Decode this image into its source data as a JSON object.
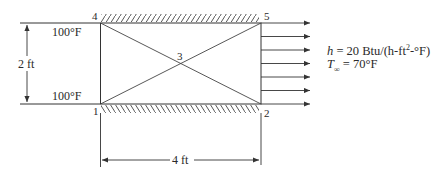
{
  "diagram": {
    "nodes": [
      {
        "id": "1",
        "label": "1"
      },
      {
        "id": "2",
        "label": "2"
      },
      {
        "id": "3",
        "label": "3"
      },
      {
        "id": "4",
        "label": "4"
      },
      {
        "id": "5",
        "label": "5"
      }
    ],
    "temperatures": {
      "top": "100°F",
      "bottom": "100°F"
    },
    "dimensions": {
      "height": "2 ft",
      "width": "4 ft"
    },
    "convection": {
      "h_symbol": "h",
      "h_value": " = 20 Btu/(h-ft",
      "h_exp": "2",
      "h_tail": "-°F)",
      "t_symbol": "T",
      "t_sub": "∞",
      "t_value": " = 70°F"
    },
    "colors": {
      "line": "#333333"
    }
  }
}
